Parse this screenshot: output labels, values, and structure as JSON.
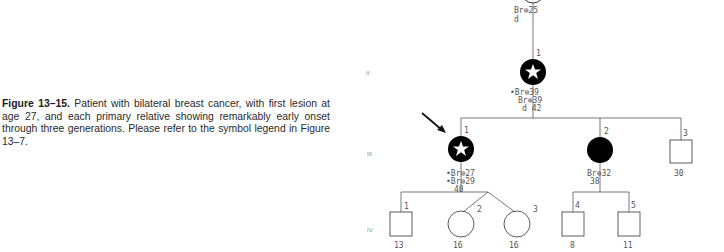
{
  "caption": {
    "label": "Figure 13–15.",
    "text": " Patient with bilateral breast cancer, with first lesion at age 27, and each primary relative showing remarkably early onset through three generations. Please refer to the symbol legend in Figure 13–7."
  },
  "pedigree": {
    "generations": [
      "II",
      "III",
      "IV"
    ],
    "gen1": {
      "line1": "Br⊕25",
      "line2": "d"
    },
    "gen2": {
      "id": "1",
      "line1": "•Br⊕39",
      "line2": "Br⊕39",
      "line3": "d  42"
    },
    "gen3": [
      {
        "id": "1",
        "line1": "•Br⊕27",
        "line2": "•Br⊕29",
        "line3": "40"
      },
      {
        "id": "2",
        "line1": "Br⊕32",
        "line2": "38"
      },
      {
        "id": "3",
        "line1": "30"
      }
    ],
    "gen4": [
      {
        "id": "1",
        "age": "13"
      },
      {
        "id": "2",
        "age": "16"
      },
      {
        "id": "3",
        "age": "16"
      },
      {
        "id": "4",
        "age": "8"
      },
      {
        "id": "5",
        "age": "11"
      }
    ]
  }
}
